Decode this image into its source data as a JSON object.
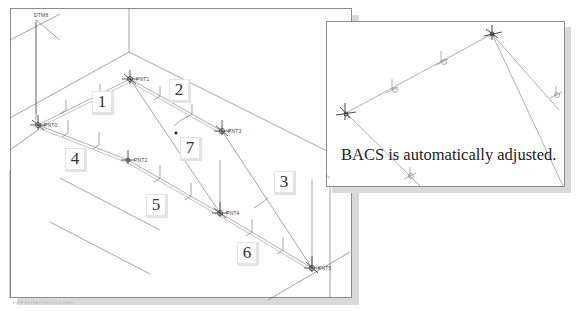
{
  "main_view": {
    "datum_label": "DTM8",
    "points": [
      {
        "id": "PNT0",
        "x": 38,
        "y": 125
      },
      {
        "id": "PNT1",
        "x": 130,
        "y": 79
      },
      {
        "id": "PNT2",
        "x": 128,
        "y": 160
      },
      {
        "id": "PNT3",
        "x": 222,
        "y": 131
      },
      {
        "id": "PNT4",
        "x": 220,
        "y": 213
      },
      {
        "id": "PNT5",
        "x": 312,
        "y": 268
      }
    ],
    "callouts": [
      {
        "label": "1",
        "x": 93,
        "y": 92
      },
      {
        "label": "2",
        "x": 170,
        "y": 80
      },
      {
        "label": "3",
        "x": 275,
        "y": 172
      },
      {
        "label": "4",
        "x": 66,
        "y": 149
      },
      {
        "label": "5",
        "x": 147,
        "y": 195
      },
      {
        "label": "6",
        "x": 238,
        "y": 243
      },
      {
        "label": "7",
        "x": 181,
        "y": 138
      }
    ],
    "footer_text": "3 DOF  EXTRA POINTS 1-5.0 DEG"
  },
  "inset_view": {
    "caption": "BACS is automatically adjusted."
  },
  "colors": {
    "line": "#555555",
    "light_line": "#999999",
    "border": "#8c8c8c",
    "shadow": "#d9d9d9"
  }
}
